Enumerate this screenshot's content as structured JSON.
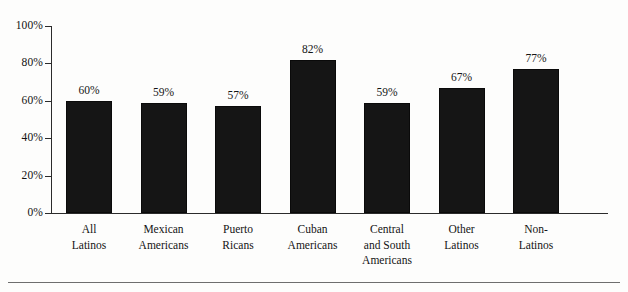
{
  "chart_data": {
    "type": "bar",
    "title": "",
    "subtitle": "",
    "xlabel": "",
    "ylabel": "",
    "ylim": [
      0,
      100
    ],
    "yticks": [
      "0%",
      "20%",
      "40%",
      "60%",
      "80%",
      "100%"
    ],
    "ytick_values": [
      0,
      20,
      40,
      60,
      80,
      100
    ],
    "grid": false,
    "legend": null,
    "bar_color": "#151515",
    "axis_color": "#2b2b2b",
    "categories": [
      "All Latinos",
      "Mexican Americans",
      "Puerto Ricans",
      "Cuban Americans",
      "Central and South Americans",
      "Other Latinos",
      "Non-Latinos"
    ],
    "category_lines": [
      [
        "All",
        "Latinos"
      ],
      [
        "Mexican",
        "Americans"
      ],
      [
        "Puerto",
        "Ricans"
      ],
      [
        "Cuban",
        "Americans"
      ],
      [
        "Central",
        "and South",
        "Americans"
      ],
      [
        "Other",
        "Latinos"
      ],
      [
        "Non-",
        "Latinos"
      ]
    ],
    "values": [
      60,
      59,
      57,
      82,
      59,
      67,
      77
    ],
    "value_labels": [
      "60%",
      "59%",
      "57%",
      "82%",
      "59%",
      "67%",
      "77%"
    ]
  }
}
